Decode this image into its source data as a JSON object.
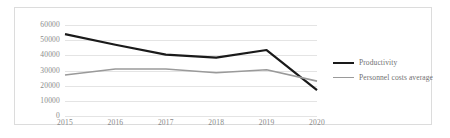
{
  "chart_data": {
    "type": "line",
    "title": "",
    "xlabel": "",
    "ylabel": "",
    "categories": [
      "2015",
      "2016",
      "2017",
      "2018",
      "2019",
      "2020"
    ],
    "ylim": [
      0,
      60000
    ],
    "yticks": [
      "0",
      "10000",
      "20000",
      "30000",
      "40000",
      "50000",
      "60000"
    ],
    "ytick_values": [
      0,
      10000,
      20000,
      30000,
      40000,
      50000,
      60000
    ],
    "grid": true,
    "legend_position": "right",
    "series": [
      {
        "name": "Productivity",
        "color": "#1a1a1a",
        "width": 2.2,
        "values": [
          54000,
          47000,
          40500,
          38500,
          43500,
          17000
        ]
      },
      {
        "name": "Personnel costs average",
        "color": "#9a9a9a",
        "width": 1.6,
        "values": [
          27000,
          31000,
          31000,
          28500,
          30500,
          23000
        ]
      }
    ]
  },
  "style": {
    "frame_color": "#dcdcdc",
    "grid_color": "#e4e4e4",
    "axis_text_color": "#8a8a8a",
    "legend_text_color": "#6f6f6f",
    "background": "#ffffff"
  }
}
